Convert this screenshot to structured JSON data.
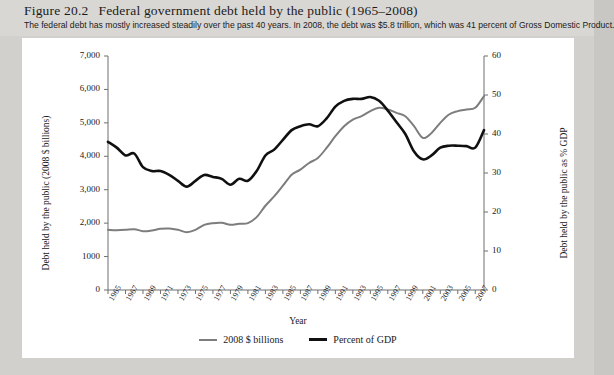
{
  "figure": {
    "number": "Figure 20.2",
    "title": "Federal government debt held by the public (1965–2008)",
    "caption": "The federal debt has mostly increased steadily over the past 40 years. In 2008, the debt was $5.8 trillion, which was 41 percent of Gross Domestic Product."
  },
  "colors": {
    "series_billions": "#7d7d7d",
    "series_pct_gdp": "#101010",
    "page_background": "#d2d0cd",
    "panel_background": "#ffffff",
    "axis": "#6f6f6f"
  },
  "chart_data": {
    "type": "line",
    "title": "Federal government debt held by the public (1965–2008)",
    "xlabel": "Year",
    "ylabel": "Debt held by the public (2008 $ billions)",
    "y2label": "Debt held by the public as % GDP",
    "xlim": [
      1965,
      2008
    ],
    "ylim": [
      0,
      7000
    ],
    "y2lim": [
      0,
      60
    ],
    "grid": false,
    "legend_position": "bottom-center",
    "y_ticks": [
      0,
      1000,
      2000,
      3000,
      4000,
      5000,
      6000,
      7000
    ],
    "y_tick_labels": [
      "0",
      "1000",
      "2,000",
      "3,000",
      "4,000",
      "5,000",
      "6,000",
      "7,000"
    ],
    "y2_ticks": [
      0,
      10,
      20,
      30,
      40,
      50,
      60
    ],
    "y2_tick_labels": [
      "0",
      "10",
      "20",
      "30",
      "40",
      "50",
      "60"
    ],
    "x_ticks": [
      1965,
      1967,
      1969,
      1971,
      1973,
      1975,
      1977,
      1979,
      1981,
      1983,
      1985,
      1987,
      1989,
      1991,
      1993,
      1995,
      1997,
      1999,
      2001,
      2003,
      2005,
      2007
    ],
    "x_tick_labels": [
      "1965",
      "1967",
      "1969",
      "1971",
      "1973",
      "1975",
      "1977",
      "1979",
      "1981",
      "1983",
      "1985",
      "1987",
      "1989",
      "1991",
      "1993",
      "1995",
      "1997",
      "1999",
      "2001",
      "2003",
      "2005",
      "2007"
    ],
    "x": [
      1965,
      1966,
      1967,
      1968,
      1969,
      1970,
      1971,
      1972,
      1973,
      1974,
      1975,
      1976,
      1977,
      1978,
      1979,
      1980,
      1981,
      1982,
      1983,
      1984,
      1985,
      1986,
      1987,
      1988,
      1989,
      1990,
      1991,
      1992,
      1993,
      1994,
      1995,
      1996,
      1997,
      1998,
      1999,
      2000,
      2001,
      2002,
      2003,
      2004,
      2005,
      2006,
      2007,
      2008
    ],
    "series": [
      {
        "name": "2008 $ billions",
        "axis": "left",
        "color": "#7d7d7d",
        "values": [
          1800,
          1790,
          1800,
          1820,
          1760,
          1780,
          1830,
          1840,
          1800,
          1730,
          1800,
          1950,
          2000,
          2010,
          1950,
          1980,
          2000,
          2180,
          2520,
          2800,
          3120,
          3450,
          3600,
          3800,
          3950,
          4250,
          4600,
          4900,
          5100,
          5200,
          5350,
          5450,
          5400,
          5300,
          5200,
          4900,
          4550,
          4700,
          5000,
          5250,
          5350,
          5400,
          5450,
          5800
        ]
      },
      {
        "name": "Percent of GDP",
        "axis": "right",
        "color": "#101010",
        "values": [
          38,
          36.5,
          34.5,
          35,
          31.5,
          30.5,
          30.5,
          29.5,
          28,
          26.5,
          28,
          29.5,
          29,
          28.5,
          27,
          28.5,
          28,
          30.5,
          34.5,
          36,
          38.5,
          41,
          42,
          42.5,
          42,
          44,
          47,
          48.5,
          49,
          49,
          49.5,
          48.5,
          46,
          43,
          40,
          35.5,
          33.5,
          34.5,
          36.5,
          37,
          37,
          36.9,
          36.5,
          41
        ]
      }
    ]
  },
  "legend": {
    "items": [
      {
        "label": "2008 $ billions",
        "color": "#7d7d7d"
      },
      {
        "label": "Percent of GDP",
        "color": "#101010"
      }
    ]
  }
}
